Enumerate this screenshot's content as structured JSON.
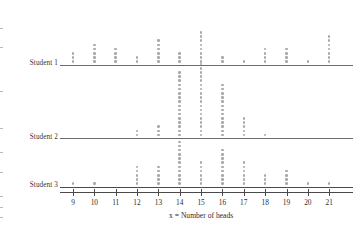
{
  "chart_data": {
    "type": "scatter",
    "subtype": "dot-plot",
    "title": "",
    "xlabel": "x = Number of heads",
    "ylabel": "",
    "grid": false,
    "legend": "none",
    "xlim": [
      8.3,
      22.2
    ],
    "xticks": [
      9,
      10,
      11,
      12,
      13,
      14,
      15,
      16,
      17,
      18,
      19,
      20,
      21
    ],
    "xtick_labels": [
      "9",
      "10",
      "11",
      "12",
      "13",
      "14",
      "15",
      "16",
      "17",
      "18",
      "19",
      "20",
      "21"
    ],
    "rows": [
      {
        "label": "Student 1",
        "x": [
          9,
          10,
          11,
          12,
          13,
          14,
          15,
          16,
          17,
          18,
          19,
          20,
          21
        ],
        "counts": [
          3,
          5,
          4,
          2,
          6,
          3,
          8,
          2,
          1,
          4,
          4,
          1,
          7
        ]
      },
      {
        "label": "Student 2",
        "x": [
          12,
          13,
          14,
          15,
          16,
          17,
          18
        ],
        "counts": [
          2,
          3,
          16,
          18,
          13,
          5,
          1
        ]
      },
      {
        "label": "Student 3",
        "x": [
          9,
          10,
          12,
          13,
          14,
          15,
          16,
          17,
          18,
          19,
          20,
          21
        ],
        "counts": [
          1,
          1,
          5,
          5,
          11,
          6,
          9,
          6,
          3,
          4,
          1,
          1
        ]
      }
    ],
    "colors": {
      "dot": "#a9a9a9",
      "axis": "#4a4a4a",
      "text": "#2e2e2e"
    }
  }
}
